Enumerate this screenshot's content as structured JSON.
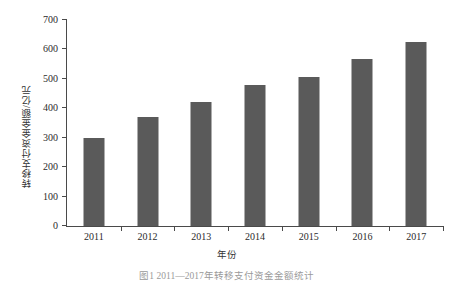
{
  "chart_data": {
    "type": "bar",
    "title": "",
    "xlabel": "年份",
    "ylabel": "转移支付资金金额/亿元",
    "categories": [
      "2011",
      "2012",
      "2013",
      "2014",
      "2015",
      "2016",
      "2017"
    ],
    "values": [
      300,
      370,
      420,
      478,
      508,
      566,
      626
    ],
    "ylim": [
      0,
      700
    ],
    "yticks": [
      "0",
      "100",
      "200",
      "300",
      "400",
      "500",
      "600",
      "700"
    ],
    "ytick_values": [
      0,
      100,
      200,
      300,
      400,
      500,
      600,
      700
    ],
    "grid": false,
    "legend": "none",
    "series_color": "#5a5a5a",
    "axis_color": "#4a4a4a"
  },
  "caption": "图1 2011—2017年转移支付资金金额统计",
  "figure": {
    "axis_label_x": "年份",
    "axis_label_y": "转移支付资金金额/亿元"
  }
}
